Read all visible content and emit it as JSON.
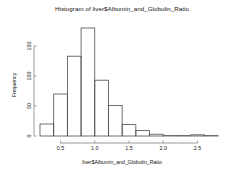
{
  "chart_data": {
    "type": "bar",
    "title": "Histogram of liver$Albumin_and_Globulin_Ratio",
    "xlabel": "liver$Albumin_and_Globulin_Ratio",
    "ylabel": "Frequency",
    "grid": false,
    "legend": null,
    "bin_width": 0.2,
    "xlim": [
      0.2,
      2.8
    ],
    "ylim": [
      0,
      180
    ],
    "xticks": [
      "0.5",
      "1.0",
      "1.5",
      "2.0",
      "2.5"
    ],
    "xtick_values": [
      0.5,
      1.0,
      1.5,
      2.0,
      2.5
    ],
    "yticks": [
      "0",
      "50",
      "100",
      "150"
    ],
    "ytick_values": [
      0,
      50,
      100,
      150
    ],
    "bins": [
      {
        "start": 0.2,
        "end": 0.4,
        "value": 20
      },
      {
        "start": 0.4,
        "end": 0.6,
        "value": 70
      },
      {
        "start": 0.6,
        "end": 0.8,
        "value": 133
      },
      {
        "start": 0.8,
        "end": 1.0,
        "value": 180
      },
      {
        "start": 1.0,
        "end": 1.2,
        "value": 93
      },
      {
        "start": 1.2,
        "end": 1.4,
        "value": 51
      },
      {
        "start": 1.4,
        "end": 1.6,
        "value": 19
      },
      {
        "start": 1.6,
        "end": 1.8,
        "value": 9
      },
      {
        "start": 1.8,
        "end": 2.0,
        "value": 3
      },
      {
        "start": 2.0,
        "end": 2.2,
        "value": 0
      },
      {
        "start": 2.2,
        "end": 2.4,
        "value": 0
      },
      {
        "start": 2.4,
        "end": 2.6,
        "value": 2
      },
      {
        "start": 2.6,
        "end": 2.8,
        "value": 0
      }
    ],
    "categories": [
      "0.2-0.4",
      "0.4-0.6",
      "0.6-0.8",
      "0.8-1.0",
      "1.0-1.2",
      "1.2-1.4",
      "1.4-1.6",
      "1.6-1.8",
      "1.8-2.0",
      "2.0-2.2",
      "2.2-2.4",
      "2.4-2.6",
      "2.6-2.8"
    ],
    "values": [
      20,
      70,
      133,
      180,
      93,
      51,
      19,
      9,
      3,
      0,
      0,
      2,
      0
    ],
    "colors": {
      "background": "#ffffff",
      "bar_stroke": "#4d4d4d",
      "bar_fill": "none",
      "axis": "#808080",
      "text": "#111111"
    }
  }
}
